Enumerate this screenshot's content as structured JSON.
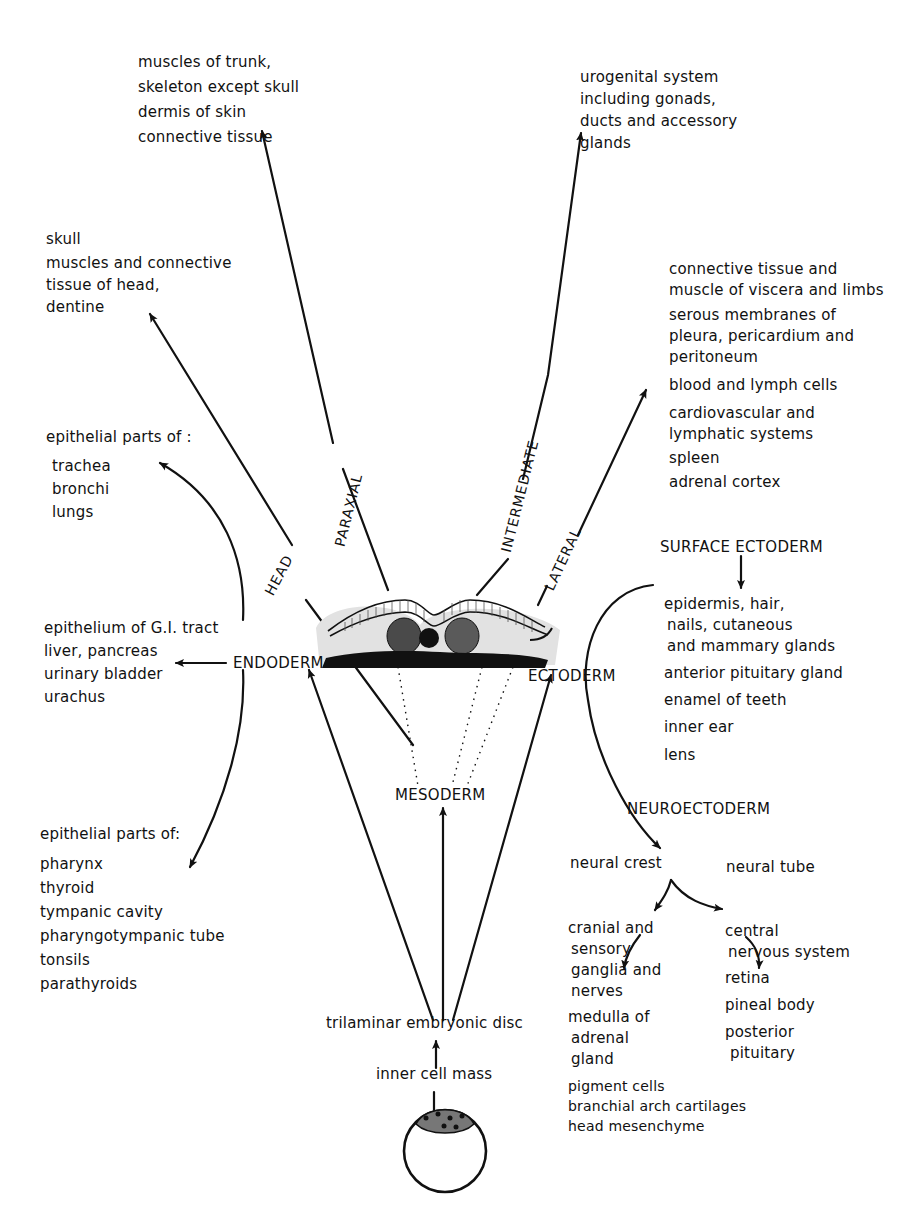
{
  "diagram": {
    "paraxial_derivatives": [
      "muscles of trunk,",
      "skeleton except skull",
      "dermis of skin",
      "connective tissue"
    ],
    "intermediate_derivatives": [
      "urogenital system",
      "including gonads,",
      "ducts and accessory",
      "glands"
    ],
    "head_derivatives": [
      "skull",
      "muscles and connective",
      "tissue of head,",
      "dentine"
    ],
    "lateral_derivatives": {
      "groups": [
        [
          "connective tissue and",
          "muscle of viscera and limbs"
        ],
        [
          "serous membranes of",
          "pleura, pericardium and",
          "peritoneum"
        ],
        [
          "blood and lymph cells"
        ],
        [
          "cardiovascular and",
          "lymphatic systems"
        ],
        [
          "spleen"
        ],
        [
          "adrenal cortex"
        ]
      ]
    },
    "endoderm_upper": {
      "heading": "epithelial parts of :",
      "items": [
        "trachea",
        "bronchi",
        "lungs"
      ]
    },
    "endoderm_middle": [
      "epithelium of G.I. tract",
      "liver, pancreas",
      "urinary bladder",
      "urachus"
    ],
    "endoderm_lower": {
      "heading": "epithelial parts of:",
      "items": [
        "pharynx",
        "thyroid",
        "tympanic cavity",
        "pharyngotympanic tube",
        "tonsils",
        "parathyroids"
      ]
    },
    "germ_layers": {
      "endoderm": "ENDODERM",
      "ectoderm": "ECTODERM",
      "mesoderm": "MESODERM"
    },
    "mesoderm_divisions": {
      "head": "HEAD",
      "paraxial": "PARAXIAL",
      "intermediate": "INTERMEDIATE",
      "lateral": "LATERAL"
    },
    "surface_ectoderm": {
      "title": "SURFACE ECTODERM",
      "groups": [
        [
          "epidermis, hair,",
          "nails, cutaneous",
          "and mammary glands"
        ],
        [
          "anterior pituitary gland"
        ],
        [
          "enamel of teeth"
        ],
        [
          "inner ear"
        ],
        [
          "lens"
        ]
      ]
    },
    "neuroectoderm": {
      "title": "NEUROECTODERM",
      "neural_crest": {
        "label": "neural crest",
        "groups": [
          [
            "cranial and",
            "sensory",
            "ganglia and",
            "nerves"
          ],
          [
            "medulla of",
            "adrenal",
            "gland"
          ],
          [
            "pigment cells",
            "branchial arch cartilages",
            "head mesenchyme"
          ]
        ]
      },
      "neural_tube": {
        "label": "neural tube",
        "groups": [
          [
            "central",
            "nervous system"
          ],
          [
            "retina"
          ],
          [
            "pineal body"
          ],
          [
            "posterior",
            "pituitary"
          ]
        ]
      }
    },
    "origin": {
      "disc": "trilaminar embryonic disc",
      "inner_cell_mass": "inner cell mass"
    },
    "colors": {
      "ink": "#111111",
      "paper": "#ffffff",
      "shade": "#d8d8d8"
    }
  }
}
